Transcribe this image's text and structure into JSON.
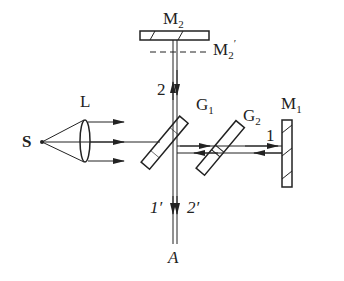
{
  "diagram": {
    "type": "Michelson interferometer",
    "labels": {
      "source": "S",
      "lens": "L",
      "mirror_2": "M",
      "mirror_2_sub": "2",
      "mirror_2_image": "M",
      "mirror_2_image_sub": "2",
      "mirror_2_image_prime": "′",
      "mirror_1": "M",
      "mirror_1_sub": "1",
      "splitter_1": "G",
      "splitter_1_sub": "1",
      "compensator_2": "G",
      "compensator_2_sub": "2",
      "beam_1": "1",
      "beam_2": "2",
      "beam_1_out": "1′",
      "beam_2_out": "2′",
      "output": "A"
    },
    "colors": {
      "line": "#222222",
      "background": "#ffffff"
    }
  }
}
